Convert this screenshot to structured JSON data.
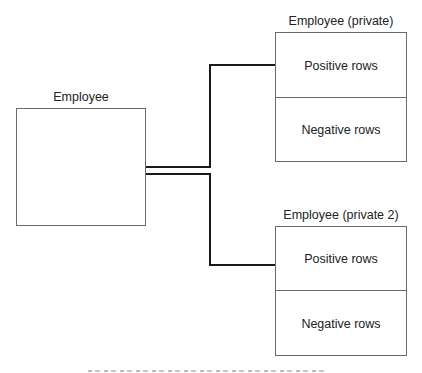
{
  "diagram": {
    "source_table": {
      "title": "Employee"
    },
    "targets": [
      {
        "title": "Employee (private)",
        "sections": [
          "Positive rows",
          "Negative rows"
        ]
      },
      {
        "title": "Employee (private 2)",
        "sections": [
          "Positive rows",
          "Negative rows"
        ]
      }
    ],
    "colors": {
      "connector": "#1a1a1a",
      "box_border": "#6b6b6b",
      "background": "#ffffff"
    }
  }
}
